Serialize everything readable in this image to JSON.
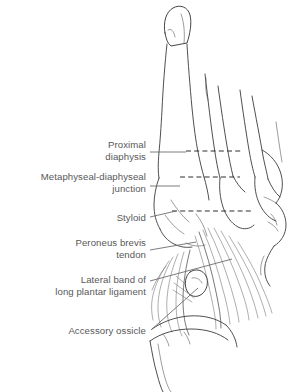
{
  "figure": {
    "background_color": "#ffffff",
    "ink_color": "#3b3b3d",
    "label_color": "#58585a",
    "leader_color": "#6d6d6f",
    "zone_line_color": "#2e2e30"
  },
  "labels": [
    {
      "id": "proximal-diaphysis",
      "lines": [
        "Proximal",
        "diaphysis"
      ],
      "line1": "Proximal",
      "line2": "diaphysis",
      "text_x": 146,
      "text_y1": 148,
      "text_y2": 160,
      "leader": "M150,152 L186,152"
    },
    {
      "id": "metaphyseal-diaphyseal-junction",
      "lines": [
        "Metaphyseal-diaphyseal",
        "junction"
      ],
      "line1": "Metaphyseal-diaphyseal",
      "line2": "junction",
      "text_x": 146,
      "text_y1": 180,
      "text_y2": 192,
      "leader": "M150,186 L180,186"
    },
    {
      "id": "styloid",
      "lines": [
        "Styloid"
      ],
      "line1": "Styloid",
      "line2": "",
      "text_x": 146,
      "text_y1": 221,
      "text_y2": 221,
      "leader": "M150,217 L176,211"
    },
    {
      "id": "peroneus-brevis-tendon",
      "lines": [
        "Peroneus brevis",
        "tendon"
      ],
      "line1": "Peroneus brevis",
      "line2": "tendon",
      "text_x": 146,
      "text_y1": 246,
      "text_y2": 258,
      "leader": "M150,250 L196,242"
    },
    {
      "id": "lateral-band-long-plantar-ligament",
      "lines": [
        "Lateral band of",
        "long plantar ligament"
      ],
      "line1": "Lateral band of",
      "line2": "long plantar ligament",
      "text_x": 146,
      "text_y1": 283,
      "text_y2": 295,
      "leader": "M150,281 L232,259"
    },
    {
      "id": "accessory-ossicle",
      "lines": [
        "Accessory ossicle"
      ],
      "line1": "Accessory ossicle",
      "line2": "",
      "text_x": 146,
      "text_y1": 334,
      "text_y2": 334,
      "leader": "M151,330 L198,288"
    }
  ],
  "zone_lines": [
    {
      "id": "zone-line-proximal-diaphysis",
      "path": "M186,151 L241,151"
    },
    {
      "id": "zone-line-metaphyseal-junction",
      "path": "M180,177 L240,177"
    },
    {
      "id": "zone-line-styloid",
      "path": "M172,211 L251,211"
    }
  ],
  "anatomy": {
    "fifth_metatarsal": "fifth-metatarsal-shaft",
    "metatarsal_head": "fifth-metatarsal-head",
    "tuberosity": "fifth-metatarsal-tuberosity-styloid",
    "cuboid": "cuboid",
    "accessory_ossicle": "accessory-ossicle-os-vesalianum",
    "adjacent_rays": [
      "fourth-metatarsal",
      "third-metatarsal",
      "second-metatarsal"
    ],
    "soft_tissue": [
      "peroneus-brevis-tendon-fibers",
      "long-plantar-ligament-lateral-band"
    ]
  }
}
